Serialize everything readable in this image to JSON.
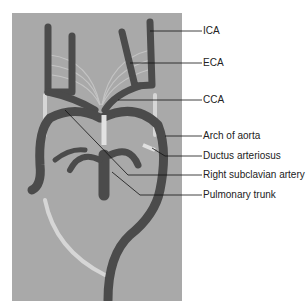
{
  "figure": {
    "colors": {
      "background_panel": "#a9a9a9",
      "vessel": "#4a4a4a",
      "ligament": "#d8d8d8",
      "leader_line": "#111111"
    },
    "labels": [
      {
        "id": "ica",
        "text": "ICA",
        "y": 31
      },
      {
        "id": "eca",
        "text": "ECA",
        "y": 63
      },
      {
        "id": "cca",
        "text": "CCA",
        "y": 100
      },
      {
        "id": "arch",
        "text": "Arch of aorta",
        "y": 136
      },
      {
        "id": "ductus",
        "text": "Ductus arteriosus",
        "y": 156
      },
      {
        "id": "rsa",
        "text": "Right subclavian artery",
        "y": 175
      },
      {
        "id": "pt",
        "text": "Pulmonary trunk",
        "y": 195
      }
    ]
  }
}
